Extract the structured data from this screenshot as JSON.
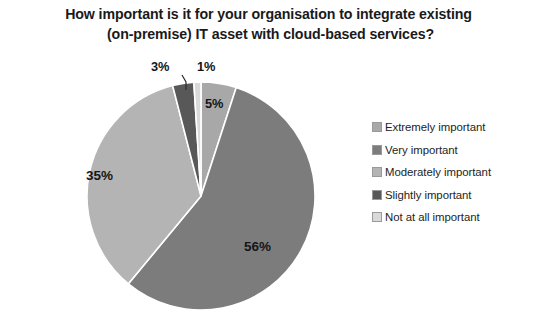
{
  "title": {
    "line1": "How important is it for your organisation to integrate existing",
    "line2": "(on-premise)  IT asset with cloud-based services?"
  },
  "chart_data": {
    "type": "pie",
    "title": "How important is it for your organisation to integrate existing (on-premise)  IT asset with cloud-based services?",
    "categories": [
      "Extremely important",
      "Very important",
      "Moderately important",
      "Slightly important",
      "Not at all important"
    ],
    "values": [
      5,
      56,
      35,
      3,
      1
    ],
    "data_labels": [
      "5%",
      "56%",
      "35%",
      "3%",
      "1%"
    ],
    "colors": [
      "#a8a8a8",
      "#7c7c7c",
      "#b4b4b4",
      "#585858",
      "#d9d9d9"
    ],
    "units": "percent",
    "start_angle_deg": 0,
    "direction": "clockwise",
    "legend_position": "right",
    "grid": false
  },
  "legend": {
    "items": [
      {
        "label": "Extremely important",
        "color": "#a8a8a8"
      },
      {
        "label": "Very important",
        "color": "#7c7c7c"
      },
      {
        "label": "Moderately important",
        "color": "#b4b4b4"
      },
      {
        "label": "Slightly important",
        "color": "#585858"
      },
      {
        "label": "Not at all important",
        "color": "#d9d9d9"
      }
    ]
  },
  "labels": {
    "pct_5": "5%",
    "pct_56": "56%",
    "pct_35": "35%",
    "pct_3": "3%",
    "pct_1": "1%"
  }
}
